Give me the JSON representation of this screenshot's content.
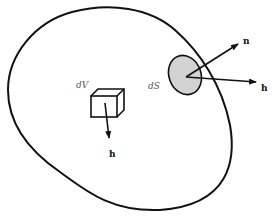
{
  "diagram": {
    "type": "volume-surface-vector-field",
    "labels": {
      "volume_element": "dV",
      "surface_element": "dS",
      "normal_vector": "n",
      "field_vector_surface": "h",
      "field_vector_volume": "h"
    },
    "colors": {
      "stroke": "#111111",
      "surface_fill": "#d3d3d3",
      "background": "#ffffff",
      "italic_label": "#555555"
    }
  }
}
